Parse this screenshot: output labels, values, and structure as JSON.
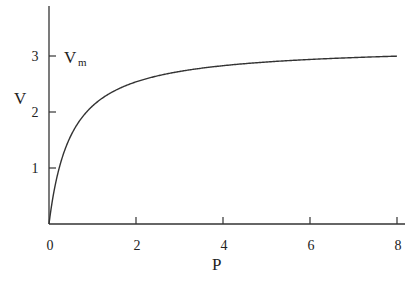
{
  "chart_data": {
    "type": "line",
    "title": "",
    "xlabel": "P",
    "ylabel": "V",
    "xlim": [
      0,
      8.2
    ],
    "ylim": [
      0,
      3.8
    ],
    "x_ticks": [
      0,
      2,
      4,
      6,
      8
    ],
    "x_tick_labels": [
      "0",
      "2",
      "4",
      "6",
      "8"
    ],
    "y_ticks": [
      1,
      2,
      3
    ],
    "y_tick_labels": [
      "1",
      "2",
      "3"
    ],
    "grid": false,
    "legend": null,
    "annotations": [
      {
        "text": "V",
        "subscript": "m",
        "x": 0.35,
        "y": 3.0,
        "meaning": "maximum velocity asymptote label at V=3"
      }
    ],
    "series": [
      {
        "name": "V(P) saturation curve",
        "formula": "V = 3.19*P/(0.514+P)",
        "x": [
          0,
          0.25,
          0.5,
          1,
          1.5,
          2,
          3,
          4,
          5,
          6,
          7,
          8
        ],
        "values": [
          0,
          1.05,
          1.57,
          2.11,
          2.38,
          2.54,
          2.72,
          2.83,
          2.89,
          2.94,
          2.97,
          3.0
        ]
      }
    ]
  },
  "labels": {
    "x_axis": "P",
    "y_axis": "V",
    "vm_main": "V",
    "vm_sub": "m"
  }
}
